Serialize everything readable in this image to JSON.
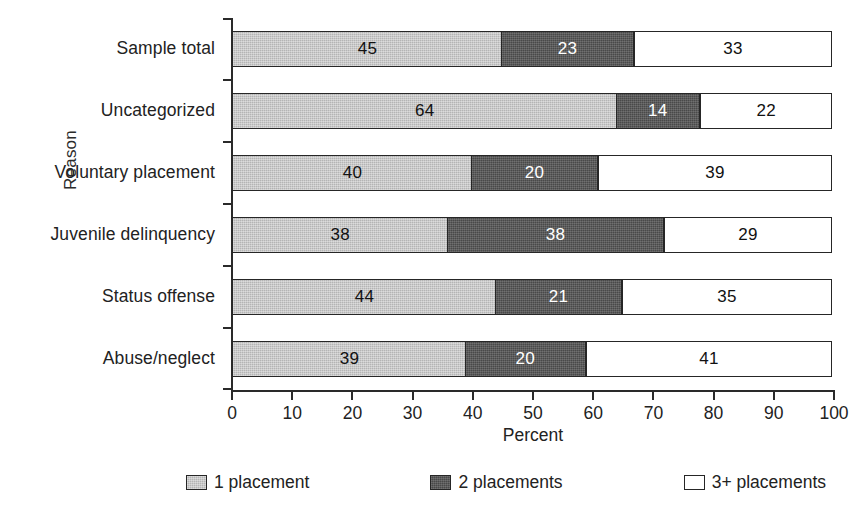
{
  "chart_data": {
    "type": "bar",
    "orientation": "horizontal",
    "stacked": true,
    "stack_mode": "percent",
    "title": "",
    "xlabel": "Percent",
    "ylabel": "Reason",
    "xlim": [
      0,
      100
    ],
    "xticks": [
      0,
      10,
      20,
      30,
      40,
      50,
      60,
      70,
      80,
      90,
      100
    ],
    "xtick_labels": [
      "0",
      "10",
      "20",
      "30",
      "40",
      "50",
      "60",
      "70",
      "80",
      "90",
      "100"
    ],
    "grid": false,
    "legend_position": "bottom",
    "categories": [
      "Sample total",
      "Uncategorized",
      "Voluntary placement",
      "Juvenile delinquency",
      "Status offense",
      "Abuse/neglect"
    ],
    "series": [
      {
        "name": "1 placement",
        "color": "#b4b4b4",
        "values": [
          45,
          64,
          40,
          38,
          44,
          39
        ]
      },
      {
        "name": "2 placements",
        "color": "#494949",
        "values": [
          23,
          14,
          20,
          38,
          21,
          20
        ]
      },
      {
        "name": "3+ placements",
        "color": "#ffffff",
        "values": [
          33,
          22,
          39,
          29,
          35,
          41
        ]
      }
    ],
    "bars": [
      {
        "category": "Sample total",
        "segments": [
          {
            "series": "1 placement",
            "label": "45",
            "value": 45,
            "start": 0,
            "end": 45
          },
          {
            "series": "2 placements",
            "label": "23",
            "value": 23,
            "start": 45,
            "end": 67
          },
          {
            "series": "3+ placements",
            "label": "33",
            "value": 33,
            "start": 67,
            "end": 100
          }
        ]
      },
      {
        "category": "Uncategorized",
        "segments": [
          {
            "series": "1 placement",
            "label": "64",
            "value": 64,
            "start": 0,
            "end": 64
          },
          {
            "series": "2 placements",
            "label": "14",
            "value": 14,
            "start": 64,
            "end": 78
          },
          {
            "series": "3+ placements",
            "label": "22",
            "value": 22,
            "start": 78,
            "end": 100
          }
        ]
      },
      {
        "category": "Voluntary placement",
        "segments": [
          {
            "series": "1 placement",
            "label": "40",
            "value": 40,
            "start": 0,
            "end": 40
          },
          {
            "series": "2 placements",
            "label": "20",
            "value": 20,
            "start": 40,
            "end": 61
          },
          {
            "series": "3+ placements",
            "label": "39",
            "value": 39,
            "start": 61,
            "end": 100
          }
        ]
      },
      {
        "category": "Juvenile delinquency",
        "segments": [
          {
            "series": "1 placement",
            "label": "38",
            "value": 38,
            "start": 0,
            "end": 36
          },
          {
            "series": "2 placements",
            "label": "38",
            "value": 38,
            "start": 36,
            "end": 72
          },
          {
            "series": "3+ placements",
            "label": "29",
            "value": 29,
            "start": 72,
            "end": 100
          }
        ]
      },
      {
        "category": "Status offense",
        "segments": [
          {
            "series": "1 placement",
            "label": "44",
            "value": 44,
            "start": 0,
            "end": 44
          },
          {
            "series": "2 placements",
            "label": "21",
            "value": 21,
            "start": 44,
            "end": 65
          },
          {
            "series": "3+ placements",
            "label": "35",
            "value": 35,
            "start": 65,
            "end": 100
          }
        ]
      },
      {
        "category": "Abuse/neglect",
        "segments": [
          {
            "series": "1 placement",
            "label": "39",
            "value": 39,
            "start": 0,
            "end": 39
          },
          {
            "series": "2 placements",
            "label": "20",
            "value": 20,
            "start": 39,
            "end": 59
          },
          {
            "series": "3+ placements",
            "label": "41",
            "value": 41,
            "start": 59,
            "end": 100
          }
        ]
      }
    ],
    "legend": [
      {
        "label": "1 placement",
        "color": "#b4b4b4"
      },
      {
        "label": "2 placements",
        "color": "#494949"
      },
      {
        "label": "3+ placements",
        "color": "#ffffff"
      }
    ]
  }
}
